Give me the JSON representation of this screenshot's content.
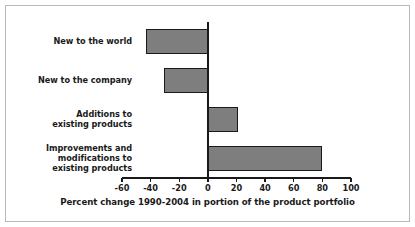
{
  "chart_data": {
    "type": "bar",
    "orientation": "horizontal",
    "title": "",
    "xlabel": "Percent change 1990-2004 in portion of the product portfolio",
    "ylabel": "",
    "categories": [
      "New to the world",
      "New to the company",
      "Additions to existing products",
      "Improvements and modifications to existing products"
    ],
    "category_lines": [
      [
        "New to the world"
      ],
      [
        "New to the company"
      ],
      [
        "Additions to",
        "existing products"
      ],
      [
        "Improvements and",
        "modifications to",
        "existing products"
      ]
    ],
    "values": [
      -43,
      -31,
      21,
      80
    ],
    "xlim": [
      -60,
      100
    ],
    "xticks": [
      -60,
      -40,
      -20,
      0,
      20,
      40,
      60,
      80,
      100
    ],
    "xtick_labels": [
      "-60",
      "-40",
      "-20",
      "0",
      "20",
      "40",
      "60",
      "80",
      "100"
    ],
    "grid": false,
    "legend": null,
    "bar_fill_color": "#7e7e7e",
    "bar_edge_color": "#1a1a1a",
    "axis_color": "#1a1a1a",
    "background_color": "#ffffff",
    "frame_color": "#b9b9b9"
  }
}
